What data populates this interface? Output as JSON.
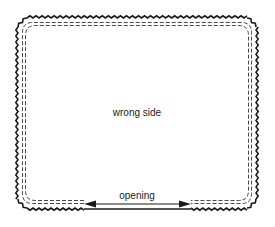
{
  "diagram": {
    "center_label": "wrong side",
    "opening_label": "opening",
    "colors": {
      "background": "#ffffff",
      "ink": "#1a1a1a"
    },
    "elements": {
      "outer_edge": "pinked zigzag edge",
      "stitch_lines": "double dashed seam lines",
      "opening_arrow": "double-headed arrow"
    }
  }
}
